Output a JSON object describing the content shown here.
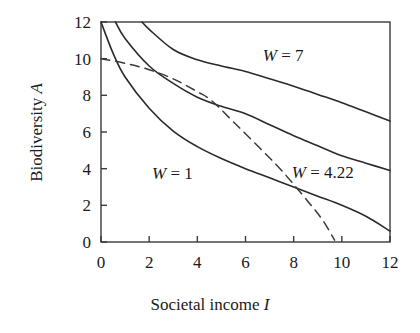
{
  "chart_data": {
    "type": "line",
    "title": "",
    "xlabel_plain": "Societal income",
    "xlabel_symbol": "I",
    "ylabel_plain": "Biodiversity",
    "ylabel_symbol": "A",
    "xlim": [
      0,
      12
    ],
    "ylim": [
      0,
      12
    ],
    "xticks": [
      "0",
      "2",
      "4",
      "6",
      "8",
      "10",
      "12"
    ],
    "yticks": [
      "0",
      "2",
      "4",
      "6",
      "8",
      "10",
      "12"
    ],
    "xtick_values": [
      0,
      2,
      4,
      6,
      8,
      10,
      12
    ],
    "ytick_values": [
      0,
      2,
      4,
      6,
      8,
      10,
      12
    ],
    "grid": false,
    "legend_position": "inline-annotations",
    "series": [
      {
        "name": "W = 7",
        "label_plain": "W",
        "label_eq": "= 7",
        "style": "solid",
        "x": [
          1.7,
          2.0,
          3.0,
          4.0,
          5.0,
          6.0,
          7.0,
          8.0,
          9.0,
          10.0,
          11.0,
          12.0
        ],
        "values": [
          12.0,
          11.6,
          10.5,
          9.94,
          9.6,
          9.3,
          8.9,
          8.5,
          8.05,
          7.6,
          7.1,
          6.6
        ]
      },
      {
        "name": "W = 4.22",
        "label_plain": "W",
        "label_eq": "= 4.22",
        "style": "solid",
        "x": [
          0.6,
          1.0,
          2.0,
          3.0,
          4.0,
          5.0,
          6.0,
          7.0,
          8.0,
          9.0,
          10.0,
          11.0,
          12.0
        ],
        "values": [
          12.0,
          11.1,
          9.6,
          8.65,
          7.9,
          7.4,
          7.0,
          6.4,
          5.8,
          5.25,
          4.7,
          4.3,
          3.9
        ]
      },
      {
        "name": "W = 1",
        "label_plain": "W",
        "label_eq": "= 1",
        "style": "solid",
        "x": [
          0.0,
          0.5,
          1.0,
          2.0,
          3.0,
          4.0,
          5.0,
          6.0,
          7.0,
          8.0,
          9.0,
          10.0,
          11.0,
          12.0
        ],
        "values": [
          12.0,
          10.3,
          9.0,
          7.3,
          6.05,
          5.2,
          4.55,
          4.0,
          3.5,
          3.0,
          2.5,
          2.0,
          1.4,
          0.6
        ]
      },
      {
        "name": "optimum-path",
        "label_plain": "",
        "label_eq": "",
        "style": "dashed",
        "x": [
          0.0,
          1.0,
          2.0,
          3.0,
          4.0,
          4.6,
          5.5,
          6.5,
          7.5,
          8.6,
          9.2,
          9.7
        ],
        "values": [
          10.0,
          9.75,
          9.4,
          8.9,
          8.2,
          7.7,
          6.55,
          5.25,
          3.9,
          2.2,
          1.2,
          0.1
        ]
      }
    ],
    "annotations": [
      {
        "text_symbol": "W",
        "text_eq": "= 7",
        "x": 7.8,
        "y": 10.15
      },
      {
        "text_symbol": "W",
        "text_eq": "= 1",
        "x": 3.2,
        "y": 3.7
      },
      {
        "text_symbol": "W",
        "text_eq": "= 4.22",
        "x": 9.0,
        "y": 3.75
      }
    ],
    "colors": {
      "axis": "#3a3a3a",
      "curve": "#2a2a2a",
      "dashed_curve": "#3a3a3a",
      "text": "#1a1a1a",
      "background": "#ffffff"
    }
  }
}
